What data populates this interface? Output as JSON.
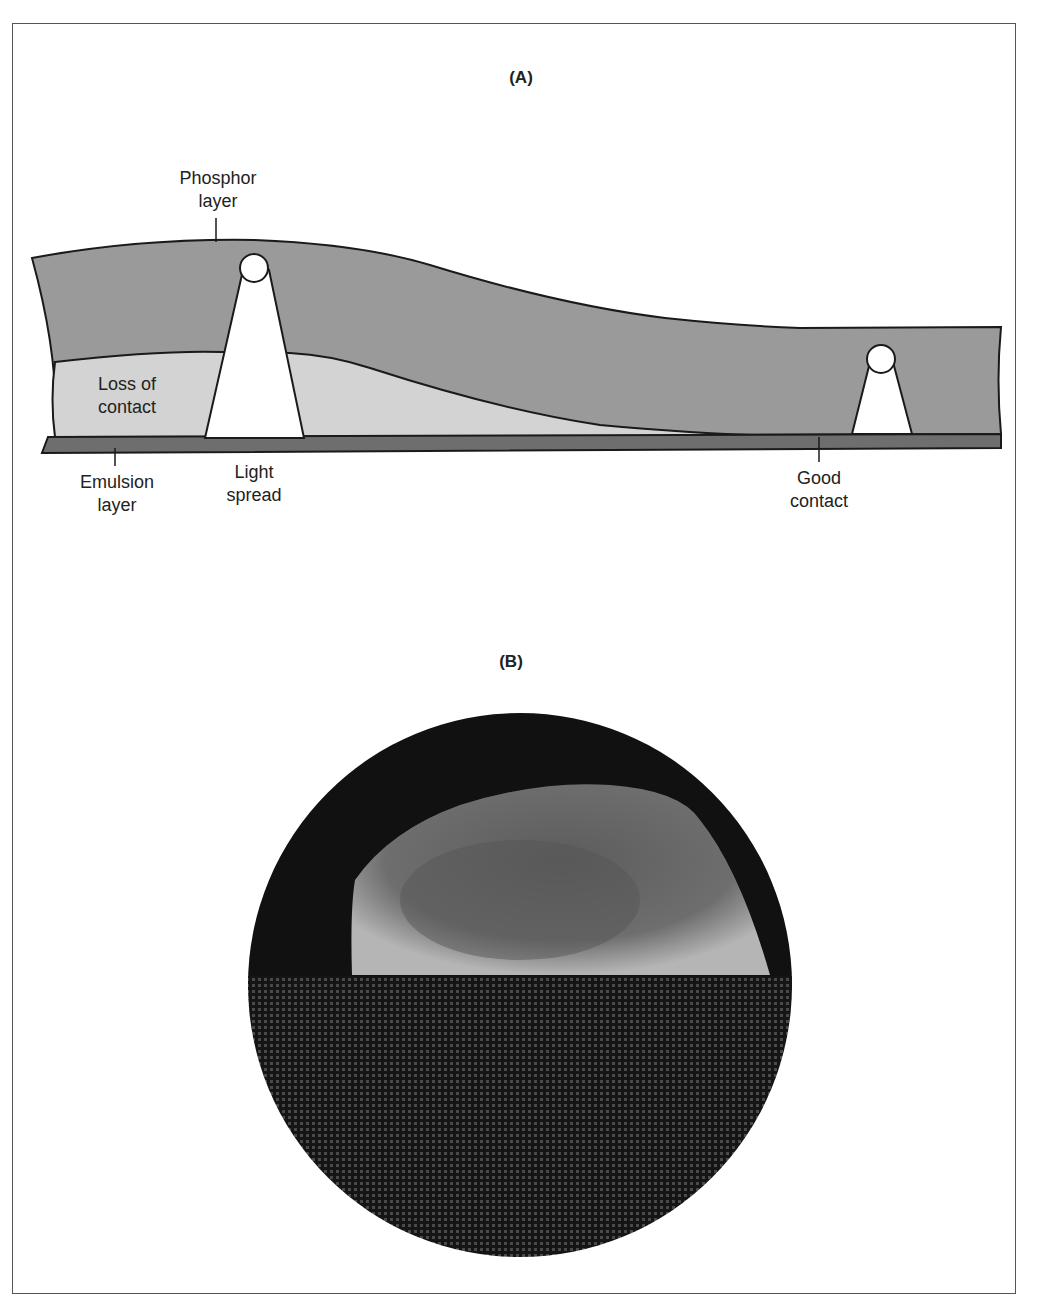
{
  "panel_a": {
    "title": "(A)",
    "labels": {
      "phosphor_layer": [
        "Phosphor",
        "layer"
      ],
      "loss_of_contact": [
        "Loss of",
        "contact"
      ],
      "emulsion_layer": [
        "Emulsion",
        "layer"
      ],
      "light_spread": [
        "Light",
        "spread"
      ],
      "good_contact": [
        "Good",
        "contact"
      ]
    }
  },
  "panel_b": {
    "title": "(B)"
  },
  "colors": {
    "phosphor": "#9a9a9a",
    "gap": "#d3d3d3",
    "emulsion": "#6e6e6e",
    "outline": "#1a1a1a",
    "photo_dark": "#111111",
    "photo_skull": "#8a8a8a",
    "frame": "#555555"
  }
}
